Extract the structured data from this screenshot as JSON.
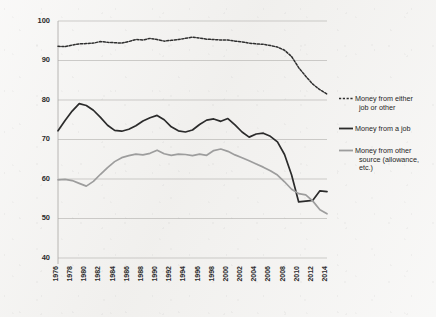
{
  "chart_data": {
    "type": "line",
    "title": "",
    "subtitle": "",
    "xlabel": "",
    "ylabel": "",
    "xlim": [
      1976,
      2014
    ],
    "ylim": [
      40,
      100
    ],
    "yticks": [
      40,
      50,
      60,
      70,
      80,
      90,
      100
    ],
    "grid": true,
    "legend_position": "right",
    "x": [
      1976,
      1977,
      1978,
      1979,
      1980,
      1981,
      1982,
      1983,
      1984,
      1985,
      1986,
      1987,
      1988,
      1989,
      1990,
      1991,
      1992,
      1993,
      1994,
      1995,
      1996,
      1997,
      1998,
      1999,
      2000,
      2001,
      2002,
      2003,
      2004,
      2005,
      2006,
      2007,
      2008,
      2009,
      2010,
      2011,
      2012,
      2013,
      2014
    ],
    "xticks": [
      1976,
      1978,
      1980,
      1982,
      1984,
      1986,
      1988,
      1990,
      1992,
      1994,
      1996,
      1998,
      2000,
      2002,
      2004,
      2006,
      2008,
      2010,
      2012,
      2014
    ],
    "xtick_labels": [
      "1976",
      "1978",
      "1980",
      "1982",
      "1984",
      "1986",
      "1988",
      "1990",
      "1992",
      "1994",
      "1996",
      "1998",
      "2000",
      "2002",
      "2004",
      "2006",
      "2008",
      "2010",
      "2012",
      "2014"
    ],
    "ytick_labels": [
      "40",
      "50",
      "60",
      "70",
      "80",
      "90",
      "100"
    ],
    "series": [
      {
        "name": "Money from either job or other",
        "style": "dashed",
        "color": "#2f2f2f",
        "values": [
          93.6,
          93.5,
          93.9,
          94.2,
          94.3,
          94.4,
          94.8,
          94.6,
          94.5,
          94.4,
          94.8,
          95.3,
          95.2,
          95.6,
          95.3,
          94.9,
          95.1,
          95.3,
          95.6,
          95.9,
          95.7,
          95.4,
          95.3,
          95.2,
          95.2,
          94.9,
          94.7,
          94.4,
          94.2,
          94.1,
          93.8,
          93.4,
          92.6,
          91.0,
          88.2,
          86.0,
          84.0,
          82.6,
          81.5
        ]
      },
      {
        "name": "Money from a job",
        "style": "solid",
        "color": "#2b2b2b",
        "values": [
          72.2,
          74.8,
          77.2,
          79.1,
          78.6,
          77.4,
          75.6,
          73.6,
          72.3,
          72.1,
          72.6,
          73.5,
          74.7,
          75.5,
          76.1,
          75.0,
          73.2,
          72.2,
          71.9,
          72.4,
          73.8,
          74.9,
          75.2,
          74.6,
          75.3,
          73.7,
          71.9,
          70.6,
          71.4,
          71.6,
          70.8,
          69.4,
          66.2,
          61.0,
          54.2,
          54.4,
          54.6,
          57.0,
          56.8
        ]
      },
      {
        "name": "Money from other source (allowance, etc.)",
        "style": "solid",
        "color": "#9d9d9d",
        "values": [
          59.8,
          59.9,
          59.6,
          58.9,
          58.2,
          59.4,
          61.2,
          62.9,
          64.4,
          65.4,
          65.9,
          66.3,
          66.1,
          66.5,
          67.3,
          66.4,
          66.0,
          66.3,
          66.2,
          65.9,
          66.3,
          66.0,
          67.2,
          67.6,
          67.0,
          66.1,
          65.4,
          64.6,
          63.8,
          63.0,
          62.1,
          61.0,
          59.3,
          57.4,
          56.3,
          56.0,
          54.4,
          52.2,
          51.2
        ]
      }
    ]
  },
  "legend": {
    "items": [
      {
        "label_line1": "Money from either",
        "label_line2": "job or other",
        "label_line3": ""
      },
      {
        "label_line1": "Money from a job",
        "label_line2": "",
        "label_line3": ""
      },
      {
        "label_line1": "Money from other",
        "label_line2": "source (allowance,",
        "label_line3": "etc.)"
      }
    ]
  }
}
